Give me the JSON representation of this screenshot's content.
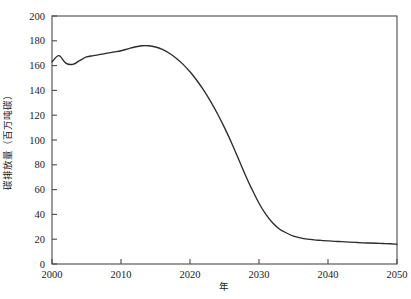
{
  "chart_data": {
    "type": "line",
    "title": "",
    "xlabel": "年",
    "ylabel": "碳排放量（百万吨碳）",
    "xlim": [
      2000,
      2050
    ],
    "ylim": [
      0,
      200
    ],
    "x_ticks": [
      "2000",
      "2010",
      "2020",
      "2030",
      "2040",
      "2050"
    ],
    "x_tick_values": [
      2000,
      2010,
      2020,
      2030,
      2040,
      2050
    ],
    "y_ticks": [
      "0",
      "20",
      "40",
      "60",
      "80",
      "100",
      "120",
      "140",
      "160",
      "180",
      "200"
    ],
    "y_tick_values": [
      0,
      20,
      40,
      60,
      80,
      100,
      120,
      140,
      160,
      180,
      200
    ],
    "grid": false,
    "legend": null,
    "legend_position": "none",
    "series": [
      {
        "name": "碳排放量",
        "color": "#2b2b2b",
        "x": [
          2000,
          2001,
          2002,
          2003,
          2004,
          2005,
          2006,
          2007,
          2008,
          2009,
          2010,
          2011,
          2012,
          2013,
          2014,
          2015,
          2016,
          2017,
          2018,
          2019,
          2020,
          2021,
          2022,
          2023,
          2024,
          2025,
          2026,
          2027,
          2028,
          2029,
          2030,
          2031,
          2032,
          2033,
          2034,
          2035,
          2036,
          2037,
          2038,
          2039,
          2040,
          2041,
          2042,
          2043,
          2044,
          2045,
          2046,
          2047,
          2048,
          2049,
          2050
        ],
        "values": [
          163,
          168,
          162,
          161,
          164,
          167,
          168,
          169,
          170,
          171,
          172,
          173.5,
          175,
          176,
          176,
          175,
          173,
          170,
          166,
          161,
          155,
          148,
          140,
          131,
          121,
          110,
          98,
          85,
          72,
          60,
          49,
          40,
          33,
          28,
          25,
          22.5,
          21,
          20,
          19.4,
          19,
          18.6,
          18.3,
          18,
          17.7,
          17.4,
          17.1,
          16.9,
          16.7,
          16.5,
          16.3,
          16
        ]
      }
    ]
  },
  "layout": {
    "plot_left": 52,
    "plot_right": 397,
    "plot_top": 16,
    "plot_bottom": 264
  }
}
